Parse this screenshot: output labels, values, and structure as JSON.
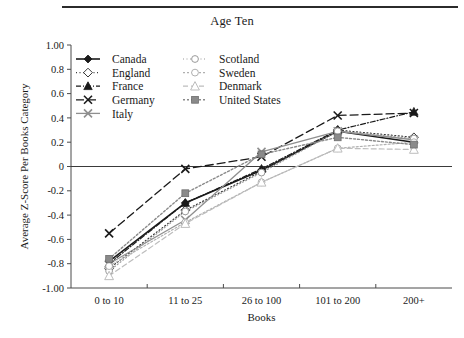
{
  "chart_data": {
    "type": "line",
    "title": "Age Ten",
    "xlabel": "Books",
    "ylabel": "Average Z-Score Per Books Category",
    "categories": [
      "0 to 10",
      "11 to 25",
      "26 to 100",
      "101 to 200",
      "200+"
    ],
    "ylim": [
      -1.0,
      1.0
    ],
    "ytick_labels": [
      "1.00",
      "0.8",
      "0.6",
      "0.4",
      "0.2",
      "0",
      "-0.2",
      "-0.4",
      "-0.6",
      "-0.8",
      "-1.00"
    ],
    "ytick_values": [
      1.0,
      0.8,
      0.6,
      0.4,
      0.2,
      0,
      -0.2,
      -0.4,
      -0.6,
      -0.8,
      -1.0
    ],
    "grid": false,
    "zero_line": true,
    "legend_position": "upper-left-inside",
    "legend_columns": 2,
    "series": [
      {
        "name": "Canada",
        "values": [
          -0.78,
          -0.3,
          -0.03,
          0.29,
          0.2
        ],
        "color": "#1a1a1a",
        "marker": "diamond-filled",
        "dash": "none",
        "width": 1.6
      },
      {
        "name": "England",
        "values": [
          -0.84,
          -0.36,
          -0.04,
          0.3,
          0.24
        ],
        "color": "#3a3a3a",
        "marker": "diamond-open",
        "dash": "1,2.5",
        "width": 1.2
      },
      {
        "name": "France",
        "values": [
          -0.8,
          -0.3,
          -0.02,
          0.3,
          0.45
        ],
        "color": "#1a1a1a",
        "marker": "triangle-filled",
        "dash": "5,2,1,2",
        "width": 1.2
      },
      {
        "name": "Germany",
        "values": [
          -0.55,
          -0.02,
          0.08,
          0.42,
          0.44
        ],
        "color": "#1a1a1a",
        "marker": "cross",
        "dash": "8,4",
        "width": 1.3
      },
      {
        "name": "Italy",
        "values": [
          -0.8,
          -0.44,
          0.12,
          0.29,
          0.22
        ],
        "color": "#8f8f8f",
        "marker": "cross",
        "dash": "none",
        "width": 1.3
      },
      {
        "name": "Scotland",
        "values": [
          -0.86,
          -0.37,
          -0.05,
          0.29,
          0.23
        ],
        "color": "#9a9a9a",
        "marker": "circle-open",
        "dash": "1,2.5",
        "width": 1.2
      },
      {
        "name": "Sweden",
        "values": [
          -0.82,
          -0.46,
          -0.13,
          0.15,
          0.2
        ],
        "color": "#b0b0b0",
        "marker": "circle-open",
        "dash": "2,2",
        "width": 1.2
      },
      {
        "name": "Denmark",
        "values": [
          -0.9,
          -0.47,
          -0.13,
          0.15,
          0.14
        ],
        "color": "#bdbdbd",
        "marker": "triangle-open",
        "dash": "5,3",
        "width": 1.2
      },
      {
        "name": "United States",
        "values": [
          -0.76,
          -0.22,
          0.1,
          0.24,
          0.18
        ],
        "color": "#8a8a8a",
        "marker": "square-filled",
        "dash": "2,2",
        "width": 1.4
      }
    ]
  },
  "legend": {
    "entries": [
      "Canada",
      "Scotland",
      "England",
      "Sweden",
      "France",
      "Denmark",
      "Germany",
      "United States",
      "Italy"
    ]
  }
}
